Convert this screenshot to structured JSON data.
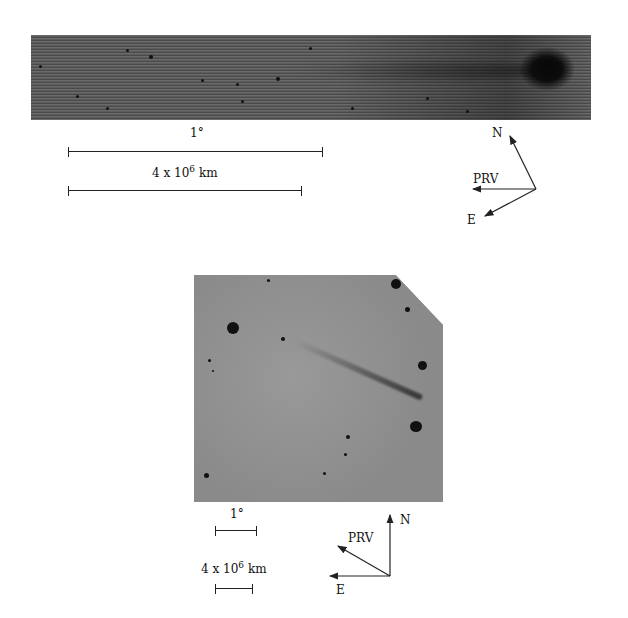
{
  "figure": {
    "top_panel": {
      "description": "comet image, elongated tail strip",
      "scale_angle_label": "1°",
      "scale_distance_label_base": "4 x 10",
      "scale_distance_exponent": "6",
      "scale_distance_unit": "km",
      "compass": {
        "north": "N",
        "east": "E",
        "prv": "PRV"
      }
    },
    "bottom_panel": {
      "description": "comet image, wide field",
      "scale_angle_label": "1°",
      "scale_distance_label_base": "4 x 10",
      "scale_distance_exponent": "6",
      "scale_distance_unit": "km",
      "compass": {
        "north": "N",
        "east": "E",
        "prv": "PRV"
      }
    }
  }
}
